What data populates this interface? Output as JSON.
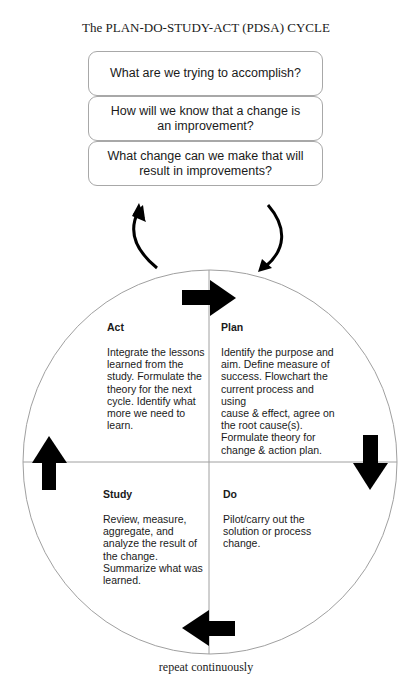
{
  "title": "The PLAN-DO-STUDY-ACT (PDSA) CYCLE",
  "questions": [
    "What are we trying to accomplish?",
    "How will we know that a change is an improvement?",
    "What change can we make that will result in improvements?"
  ],
  "quadrants": {
    "act": {
      "title": "Act",
      "body": "Integrate the lessons\nlearned from the\nstudy.  Formulate the\ntheory for the next\ncycle.  Identify what\nmore we need to\nlearn."
    },
    "plan": {
      "title": "Plan",
      "body": "Identify the purpose and\naim.  Define measure of\nsuccess. Flowchart the\ncurrent process and using\ncause & effect, agree on\nthe root cause(s).\nFormulate theory for\nchange & action plan."
    },
    "study": {
      "title": "Study",
      "body": "Review, measure,\naggregate, and\nanalyze the result of\nthe change.\nSummarize what was\nlearned."
    },
    "do": {
      "title": "Do",
      "body": "Pilot/carry out the\nsolution or process\nchange."
    }
  },
  "footer": "repeat continuously",
  "icons": {
    "cycle_arrows": [
      "arrow-right-icon",
      "arrow-down-icon",
      "arrow-left-icon",
      "arrow-up-icon"
    ],
    "loop_arrows": [
      "curved-arrow-up-icon",
      "curved-arrow-down-icon"
    ]
  },
  "colors": {
    "line": "#a0a0a0",
    "arrow": "#000000",
    "text": "#1a1a1a"
  }
}
